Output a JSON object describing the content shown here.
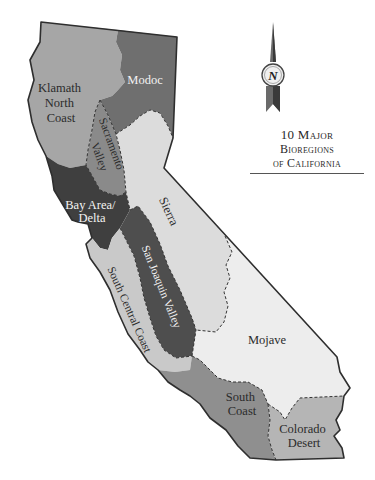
{
  "title": {
    "line1": "10 Major",
    "line2": "Bioregions",
    "line3": "of California"
  },
  "compass": {
    "icon": "north-arrow-icon",
    "label": "N"
  },
  "regions": [
    {
      "id": "klamath-north-coast",
      "label_lines": [
        "Klamath",
        "North",
        "Coast"
      ],
      "fill": "#a6a6a6",
      "text_color": "#2b2b2b"
    },
    {
      "id": "modoc",
      "label_lines": [
        "Modoc"
      ],
      "fill": "#6f6f6f",
      "text_color": "#f2f2f2"
    },
    {
      "id": "sacramento-valley",
      "label_lines": [
        "Sacramento",
        "Valley"
      ],
      "fill": "#8a8a8a",
      "text_color": "#2b2b2b"
    },
    {
      "id": "bay-area-delta",
      "label_lines": [
        "Bay Area/",
        "Delta"
      ],
      "fill": "#3f3f3f",
      "text_color": "#f2f2f2"
    },
    {
      "id": "sierra",
      "label_lines": [
        "Sierra"
      ],
      "fill": "#dcdcdc",
      "text_color": "#2b2b2b"
    },
    {
      "id": "san-joaquin-valley",
      "label_lines": [
        "San Joaquin Valley"
      ],
      "fill": "#4e4e4e",
      "text_color": "#f2f2f2"
    },
    {
      "id": "south-central-coast",
      "label_lines": [
        "South Central Coast"
      ],
      "fill": "#c9c9c9",
      "text_color": "#2b2b2b"
    },
    {
      "id": "mojave",
      "label_lines": [
        "Mojave"
      ],
      "fill": "#ededed",
      "text_color": "#2b2b2b"
    },
    {
      "id": "south-coast",
      "label_lines": [
        "South",
        "Coast"
      ],
      "fill": "#8f8f8f",
      "text_color": "#2b2b2b"
    },
    {
      "id": "colorado-desert",
      "label_lines": [
        "Colorado",
        "Desert"
      ],
      "fill": "#b5b5b5",
      "text_color": "#2b2b2b"
    }
  ],
  "colors": {
    "outline": "#2e2e2e",
    "boundary_dash": "#333333",
    "background": "#ffffff"
  }
}
